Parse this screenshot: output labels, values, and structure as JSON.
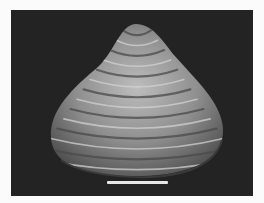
{
  "image": {
    "subject": "bivalve shell (clam) photographed on black background",
    "background_color": "#232323",
    "page_color": "#fbfbfb",
    "shell_colors": {
      "highlight": "#cfcfcf",
      "mid": "#8a8a8a",
      "shadow": "#4a4a4a"
    },
    "scale_bar": {
      "color": "#e6e6e6",
      "label": ""
    }
  }
}
